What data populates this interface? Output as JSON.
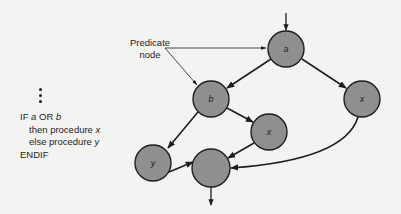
{
  "diagram": {
    "type": "flow-graph",
    "annotation": {
      "label_line1": "Predicate",
      "label_line2": "node",
      "points_to": [
        "a",
        "b"
      ]
    },
    "code": {
      "line1_prefix": "IF ",
      "line1_a": "a",
      "line1_mid": " OR ",
      "line1_b": "b",
      "line2_prefix": "then procedure ",
      "line2_var": "x",
      "line3_prefix": "else procedure ",
      "line3_var": "y",
      "line4": "ENDIF"
    },
    "nodes": [
      {
        "id": "a",
        "label": "a",
        "cx": 286,
        "cy": 49,
        "r": 18
      },
      {
        "id": "b",
        "label": "b",
        "cx": 211,
        "cy": 99,
        "r": 18
      },
      {
        "id": "x_right",
        "label": "x",
        "cx": 362,
        "cy": 99,
        "r": 18
      },
      {
        "id": "y",
        "label": "y",
        "cx": 153,
        "cy": 163,
        "r": 18
      },
      {
        "id": "x_mid",
        "label": "x",
        "cx": 269,
        "cy": 132,
        "r": 18
      },
      {
        "id": "merge",
        "label": "",
        "cx": 211,
        "cy": 168,
        "r": 19
      }
    ],
    "edges": [
      {
        "from": "entry",
        "to": "a"
      },
      {
        "from": "a",
        "to": "b"
      },
      {
        "from": "a",
        "to": "x_right"
      },
      {
        "from": "b",
        "to": "y"
      },
      {
        "from": "b",
        "to": "x_mid"
      },
      {
        "from": "y",
        "to": "merge"
      },
      {
        "from": "x_mid",
        "to": "merge"
      },
      {
        "from": "x_right",
        "to": "merge"
      },
      {
        "from": "merge",
        "to": "exit"
      }
    ],
    "colors": {
      "node_fill": "#8f8f8f",
      "node_stroke": "#1e1e1e",
      "edge": "#1e1e1e",
      "background": "#f3f3f1"
    }
  }
}
